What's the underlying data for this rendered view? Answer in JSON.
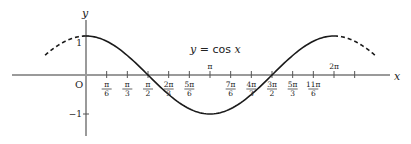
{
  "chart_data": {
    "type": "line",
    "title": "y = cos x",
    "title_parts": {
      "lhs": "y",
      "eq": " = ",
      "fn": "cos ",
      "var": "x"
    },
    "xlabel": "x",
    "ylabel": "y",
    "origin_label": "O",
    "function": "cos",
    "xlim_pi": [
      -0.6,
      2.45
    ],
    "ylim": [
      -1.5,
      1.45
    ],
    "grid": false,
    "legend": "none",
    "solid_range_pi": [
      0,
      2
    ],
    "dashed_ranges_pi": [
      [
        -0.33,
        0
      ],
      [
        2,
        2.33
      ]
    ],
    "y_ticks": [
      {
        "value": 1,
        "label": "1"
      },
      {
        "value": -1,
        "label": "−1"
      }
    ],
    "x_ticks": [
      {
        "value_pi": 0.1667,
        "num": "π",
        "den": "6",
        "pos": "below"
      },
      {
        "value_pi": 0.3333,
        "num": "π",
        "den": "3",
        "pos": "below"
      },
      {
        "value_pi": 0.5,
        "num": "π",
        "den": "2",
        "pos": "below"
      },
      {
        "value_pi": 0.6667,
        "num": "2π",
        "den": "3",
        "pos": "below"
      },
      {
        "value_pi": 0.8333,
        "num": "5π",
        "den": "6",
        "pos": "below"
      },
      {
        "value_pi": 1.0,
        "num": "π",
        "den": "",
        "pos": "above"
      },
      {
        "value_pi": 1.1667,
        "num": "7π",
        "den": "6",
        "pos": "below"
      },
      {
        "value_pi": 1.3333,
        "num": "4π",
        "den": "3",
        "pos": "below"
      },
      {
        "value_pi": 1.5,
        "num": "3π",
        "den": "2",
        "pos": "below"
      },
      {
        "value_pi": 1.6667,
        "num": "5π",
        "den": "3",
        "pos": "below"
      },
      {
        "value_pi": 1.8333,
        "num": "11π",
        "den": "6",
        "pos": "below"
      },
      {
        "value_pi": 2.0,
        "num": "2π",
        "den": "",
        "pos": "above"
      },
      {
        "value_pi": 2.1667,
        "num": "",
        "den": "",
        "pos": "none"
      }
    ]
  }
}
